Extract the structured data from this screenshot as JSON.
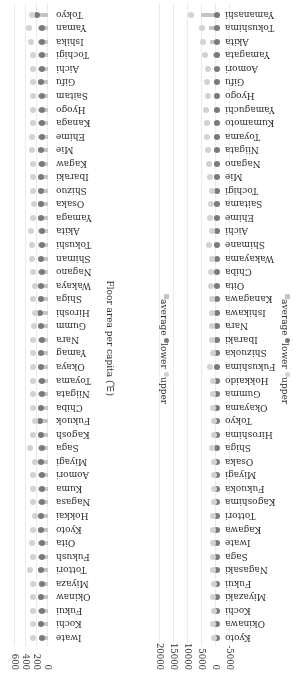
{
  "chart_data": [
    {
      "type": "bar",
      "subtype": "range-dot",
      "title": "",
      "xlabel": "",
      "ylabel": "",
      "axis_ticks": [
        0,
        200,
        400,
        600
      ],
      "xlim": [
        0,
        650
      ],
      "legend": [
        "average",
        "lower",
        "upper"
      ],
      "legend_position": "bottom",
      "categories": [
        "Iwate",
        "Kochi",
        "Fukui",
        "Okinaw",
        "Miyaza",
        "Tottori",
        "Fukush",
        "Oita",
        "Kyoto",
        "Hokkai",
        "Nagasa",
        "Kuma",
        "Aomori",
        "Miyagi",
        "Saga",
        "Kagosh",
        "Fukuok",
        "Chiba",
        "Niigata",
        "Toyama",
        "Okaya",
        "Yamag",
        "Nara",
        "Gumm",
        "Hiroshi",
        "Shiga",
        "Wakaya",
        "Nagano",
        "Shiman",
        "Tokushi",
        "Akita",
        "Yamaga",
        "Osaka",
        "Shizuo",
        "Ibaraki",
        "Kagaw",
        "Mie",
        "Ehime",
        "Kanaga",
        "Hyogo",
        "Saitam",
        "Gifu",
        "Aichi",
        "Tochigi",
        "Ishika",
        "Yaman",
        "Tokyo"
      ],
      "series": [
        {
          "name": "average",
          "values": [
            170,
            180,
            175,
            185,
            170,
            190,
            180,
            175,
            180,
            185,
            175,
            180,
            175,
            180,
            185,
            180,
            175,
            180,
            185,
            180,
            175,
            185,
            180,
            175,
            180,
            175,
            185,
            180,
            175,
            190,
            185,
            180,
            175,
            180,
            185,
            180,
            175,
            180,
            185,
            175,
            180,
            185,
            180,
            185,
            190,
            185,
            150
          ]
        },
        {
          "name": "lower",
          "values": [
            110,
            120,
            115,
            120,
            110,
            120,
            115,
            115,
            120,
            135,
            110,
            115,
            115,
            135,
            115,
            120,
            140,
            130,
            115,
            115,
            120,
            120,
            115,
            125,
            140,
            120,
            135,
            115,
            120,
            115,
            115,
            120,
            120,
            125,
            120,
            115,
            120,
            115,
            110,
            115,
            115,
            120,
            115,
            115,
            115,
            110,
            195
          ]
        },
        {
          "name": "upper",
          "values": [
            280,
            270,
            275,
            280,
            275,
            320,
            275,
            290,
            280,
            245,
            270,
            275,
            270,
            245,
            335,
            270,
            235,
            265,
            270,
            265,
            280,
            280,
            270,
            250,
            240,
            265,
            245,
            275,
            290,
            295,
            305,
            280,
            250,
            275,
            265,
            275,
            285,
            285,
            275,
            270,
            280,
            280,
            270,
            275,
            300,
            340,
            285
          ]
        }
      ]
    },
    {
      "type": "bar",
      "subtype": "range-dot",
      "title": "",
      "xlabel": "Floor area per capita (㎡)",
      "ylabel": "",
      "axis_ticks": [
        -5000,
        0,
        5000,
        10000,
        15000,
        20000
      ],
      "xlim": [
        -5000,
        21000
      ],
      "legend": [
        "average",
        "lower",
        "upper"
      ],
      "legend_position": "bottom",
      "categories": [
        "Kyoto",
        "Okinawa",
        "Kochi",
        "Miyazaki",
        "Fukui",
        "Nagasaki",
        "Saga",
        "Iwate",
        "Kagawa",
        "Tottori",
        "Kagoshima",
        "Fukuoka",
        "Miyagi",
        "Osaka",
        "Shiga",
        "Hiroshima",
        "Tokyo",
        "Okayama",
        "Gumma",
        "Hokkaido",
        "Fukushima",
        "Shizuoka",
        "Ibaraki",
        "Nara",
        "Ishikawa",
        "Kanagawa",
        "Oita",
        "Chiba",
        "Wakayama",
        "Shimane",
        "Aichi",
        "Ehime",
        "Saitama",
        "Tochigi",
        "Mie",
        "Nagano",
        "Niigata",
        "Toyama",
        "Kumamoto",
        "Yamaguchi",
        "Hyogo",
        "Gifu",
        "Aomori",
        "Yamagata",
        "Akita",
        "Tokushima",
        "Yamanashi"
      ],
      "series": [
        {
          "name": "average",
          "values": [
            200,
            300,
            200,
            500,
            200,
            200,
            300,
            200,
            300,
            200,
            400,
            300,
            300,
            300,
            500,
            300,
            200,
            300,
            300,
            300,
            600,
            300,
            400,
            300,
            500,
            600,
            500,
            300,
            300,
            400,
            300,
            400,
            500,
            300,
            300,
            400,
            400,
            400,
            500,
            800,
            300,
            500,
            400,
            1200,
            2000,
            2500,
            5500
          ]
        },
        {
          "name": "lower",
          "values": [
            -300,
            -200,
            -300,
            -200,
            -300,
            -300,
            -300,
            -200,
            -200,
            -200,
            -300,
            -300,
            -300,
            -300,
            -300,
            -300,
            -400,
            -300,
            -300,
            -300,
            -300,
            -300,
            -300,
            -300,
            -200,
            -200,
            -200,
            -200,
            -400,
            -300,
            -300,
            -300,
            -300,
            -300,
            -300,
            -300,
            -300,
            -300,
            -300,
            -300,
            -300,
            -300,
            -300,
            -300,
            -300,
            -300,
            -300
          ]
        },
        {
          "name": "upper",
          "values": [
            600,
            900,
            800,
            1200,
            700,
            900,
            1000,
            900,
            1000,
            1000,
            800,
            800,
            800,
            800,
            1400,
            800,
            600,
            900,
            1200,
            1000,
            2200,
            1000,
            1300,
            1400,
            1400,
            1600,
            1800,
            1700,
            1400,
            2600,
            1400,
            2300,
            1800,
            1500,
            2200,
            2400,
            2800,
            3100,
            3300,
            3600,
            3000,
            3200,
            3000,
            3900,
            4500,
            4900,
            8800
          ]
        }
      ]
    }
  ],
  "chartA": {
    "ticks": [
      {
        "label": "0",
        "v": 0
      },
      {
        "label": "200",
        "v": 200
      },
      {
        "label": "400",
        "v": 400
      },
      {
        "label": "600",
        "v": 600
      }
    ]
  },
  "chartB": {
    "ticks": [
      {
        "label": "-5000",
        "v": -5000
      },
      {
        "label": "0",
        "v": 0
      },
      {
        "label": "5000",
        "v": 5000
      },
      {
        "label": "10000",
        "v": 10000
      },
      {
        "label": "15000",
        "v": 15000
      },
      {
        "label": "20000",
        "v": 20000
      }
    ]
  },
  "legend": {
    "average": "average",
    "lower": "lower",
    "upper": "upper"
  },
  "axis_title": "Floor area per capita (㎡)",
  "colors": {
    "average": "#c4c4c4",
    "lower": "#7a7a7a",
    "upper": "#d2d2d2",
    "grid": "#ececec"
  }
}
